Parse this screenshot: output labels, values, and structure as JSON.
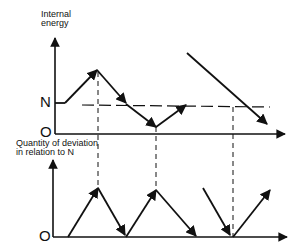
{
  "diagram": {
    "top_chart": {
      "y_axis_label_line1": "Internal",
      "y_axis_label_line2": "energy",
      "level_label": "N",
      "origin_label": "O"
    },
    "bottom_chart": {
      "y_axis_label_line1": "Quantity of deviation",
      "y_axis_label_line2": "in relation to N",
      "origin_label": "O"
    },
    "colors": {
      "ink": "#111111",
      "background": "#ffffff"
    }
  }
}
